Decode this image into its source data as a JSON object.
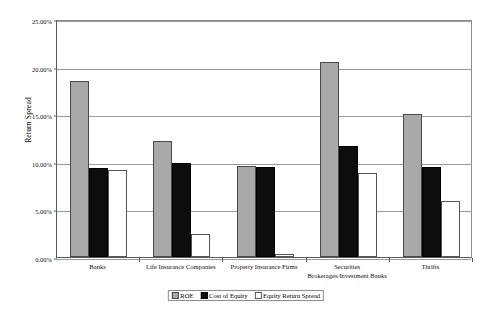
{
  "chart_data": {
    "type": "bar",
    "title": "",
    "xlabel": "",
    "ylabel": "Return Spread",
    "ylim": [
      0,
      25
    ],
    "ytick_labels": [
      "0.00%",
      "5.00%",
      "10.00%",
      "15.00%",
      "20.00%",
      "25.00%"
    ],
    "ytick_values": [
      0,
      5,
      10,
      15,
      20,
      25
    ],
    "grid": true,
    "legend_position": "bottom-center",
    "categories": [
      "Banks",
      "Life Insurance Companies",
      "Property Insurance Firms",
      "Securities Brokerages/Investment Banks",
      "Thrifts"
    ],
    "series": [
      {
        "name": "ROE",
        "color": "#a9a9a9",
        "values": [
          18.5,
          12.2,
          9.6,
          20.5,
          15.05
        ]
      },
      {
        "name": "Cost of Equity",
        "color": "#0d0d0d",
        "values": [
          9.3,
          9.85,
          9.5,
          11.65,
          9.45
        ]
      },
      {
        "name": "Equity Return Spread",
        "color": "#ffffff",
        "values": [
          9.1,
          2.45,
          0.3,
          8.85,
          5.85
        ]
      }
    ]
  },
  "axis": {
    "y_title": "Return Spread"
  },
  "legend": {
    "items": [
      {
        "label": "ROE",
        "swatch": "roe"
      },
      {
        "label": "Cost of Equity",
        "swatch": "coe"
      },
      {
        "label": "Equity Return Spread",
        "swatch": "spread"
      }
    ]
  }
}
